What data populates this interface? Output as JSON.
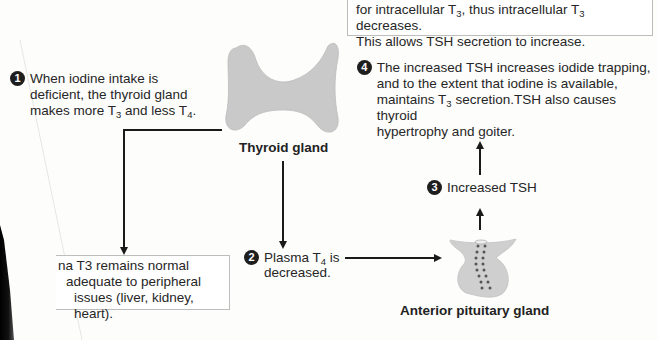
{
  "top_box": {
    "line1": "for intracellular T",
    "line1_sub": "3",
    "line1_mid": ", thus intracellular T",
    "line1_sub2": "3",
    "line1_end": " decreases.",
    "line2": "This allows TSH secretion to increase."
  },
  "step1": {
    "number": "1",
    "line1": "When iodine intake is",
    "line2": "deficient, the thyroid gland",
    "line3_a": "makes more T",
    "line3_sub1": "3",
    "line3_b": " and less T",
    "line3_sub2": "4",
    "line3_c": "."
  },
  "step4": {
    "number": "4",
    "line1": "The increased TSH increases iodide trapping,",
    "line2": "and to the extent that iodine is available,",
    "line3_a": "maintains T",
    "line3_sub": "3",
    "line3_b": " secretion.TSH also causes thyroid",
    "line4": "hypertrophy and goiter."
  },
  "thyroid": {
    "label": "Thyroid gland",
    "color": "#c9c9c9"
  },
  "step3": {
    "number": "3",
    "label": "Increased TSH"
  },
  "step2": {
    "number": "2",
    "line1_a": "Plasma T",
    "line1_sub": "4",
    "line1_b": " is",
    "line2": "decreased."
  },
  "pituitary": {
    "label": "Anterior pituitary gland",
    "color": "#cfcfcf"
  },
  "bottom_box": {
    "line1": "na T3 remains normal",
    "line2": "adequate to peripheral",
    "line3": "issues (liver, kidney, heart)."
  }
}
